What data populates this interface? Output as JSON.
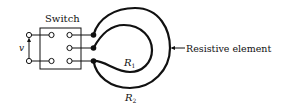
{
  "diagram": {
    "switch_label": "Switch",
    "voltage_label": "v",
    "r1_label": "R",
    "r1_sub": "1",
    "r2_label": "R",
    "r2_sub": "2",
    "element_label": "Resistive element",
    "colors": {
      "ink": "#111111",
      "background": "#ffffff"
    }
  }
}
